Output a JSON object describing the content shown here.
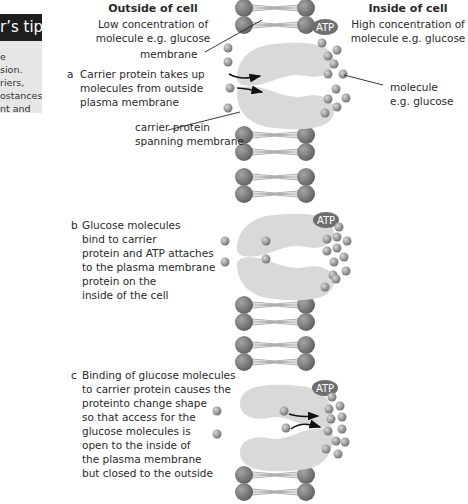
{
  "tip_box": {
    "title": "r’s tip",
    "lines": [
      "e",
      "sion.",
      "riers,",
      "ostances",
      "nt and"
    ]
  },
  "header_left": {
    "title": "Outside of cell",
    "line1": "Low concentration of",
    "line2": "molecule e.g. glucose"
  },
  "header_right": {
    "title": "Inside of cell",
    "line1": "High concentration of",
    "line2": "molecule e.g. glucose"
  },
  "labels": {
    "membrane": "membrane",
    "carrier_line1": "carrier protein",
    "carrier_line2": "spanning membrane",
    "molecule_line1": "molecule",
    "molecule_line2": "e.g. glucose",
    "atp": "ATP"
  },
  "steps": [
    {
      "letter": "a",
      "lines": [
        "Carrier protein takes up",
        "molecules from outside",
        "plasma membrane"
      ]
    },
    {
      "letter": "b",
      "lines": [
        "Glucose molecules",
        "bind to carrier",
        "protein and ATP attaches",
        "to the plasma membrane",
        "protein on the",
        "inside of the cell"
      ]
    },
    {
      "letter": "c",
      "lines": [
        "Binding of glucose molecules",
        "to carrier protein causes the",
        "proteinto change shape",
        "so that access for the",
        "glucose molecules is",
        "open to the inside of",
        "the plasma membrane",
        "but closed to the outside"
      ]
    }
  ],
  "colors": {
    "phospholipid_head": "#7a7a7a",
    "protein": "#d9d9d9",
    "molecule": "#8c8c8c",
    "atp_badge": "#6e6e6e",
    "tip_header": "#1e1e1e",
    "tip_body": "#e6e6e6"
  }
}
